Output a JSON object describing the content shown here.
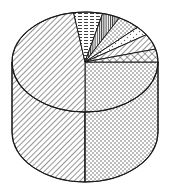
{
  "figure": {
    "title": "",
    "background": "#ffffff",
    "stroke_color": "#1a1a1a",
    "fill_color": "#ffffff"
  },
  "geometry": {
    "center_x": 85,
    "center_y": 62,
    "radius_x": 73,
    "radius_y": 50,
    "depth": 70,
    "start_angle_deg": 0,
    "direction": "clockwise"
  },
  "chart_data": {
    "type": "pie",
    "title": "",
    "subtitle": "",
    "xlabel": "",
    "ylabel": "",
    "legend_position": "none",
    "grid": false,
    "three_d": true,
    "three_d_style": "cylinder",
    "total": 100,
    "categories": [
      "Slice 1",
      "Slice 2",
      "Slice 3",
      "Slice 4",
      "Slice 5",
      "Slice 6",
      "Slice 7",
      "Slice 8"
    ],
    "values": [
      25.0,
      47.5,
      6.5,
      4.0,
      5.0,
      3.0,
      5.0,
      4.0
    ],
    "labels": [],
    "slices": [
      {
        "name": "Slice 1",
        "value": 25.0,
        "start_deg": 0,
        "end_deg": 90,
        "pattern": "dots",
        "pattern_label": "fine-dot-stipple",
        "fill": "#ffffff",
        "stroke": "#1a1a1a"
      },
      {
        "name": "Slice 2",
        "value": 47.5,
        "start_deg": 90,
        "end_deg": 261,
        "pattern": "diagonal-hatch",
        "pattern_label": "diagonal-hatch-45",
        "fill": "#ffffff",
        "stroke": "#1a1a1a"
      },
      {
        "name": "Slice 3",
        "value": 6.5,
        "start_deg": 261,
        "end_deg": 284,
        "pattern": "horizontal-dash",
        "pattern_label": "horizontal-dashed-lines",
        "fill": "#ffffff",
        "stroke": "#1a1a1a"
      },
      {
        "name": "Slice 4",
        "value": 4.0,
        "start_deg": 284,
        "end_deg": 298,
        "pattern": "vertical-lines",
        "pattern_label": "dense-vertical-lines",
        "fill": "#ffffff",
        "stroke": "#1a1a1a"
      },
      {
        "name": "Slice 5",
        "value": 5.0,
        "start_deg": 298,
        "end_deg": 316,
        "pattern": "dots",
        "pattern_label": "fine-dot-stipple",
        "fill": "#ffffff",
        "stroke": "#1a1a1a"
      },
      {
        "name": "Slice 6",
        "value": 3.0,
        "start_deg": 316,
        "end_deg": 327,
        "pattern": "sparse-dots",
        "pattern_label": "sparse-dot-stipple",
        "fill": "#ffffff",
        "stroke": "#1a1a1a"
      },
      {
        "name": "Slice 7",
        "value": 5.0,
        "start_deg": 327,
        "end_deg": 345,
        "pattern": "diagonal-hatch",
        "pattern_label": "diagonal-hatch-45",
        "fill": "#ffffff",
        "stroke": "#1a1a1a"
      },
      {
        "name": "Slice 8",
        "value": 4.0,
        "start_deg": 345,
        "end_deg": 360,
        "pattern": "cross-hatch",
        "pattern_label": "diagonal-cross-hatch",
        "fill": "#ffffff",
        "stroke": "#1a1a1a"
      }
    ],
    "side_walls": [
      {
        "name": "Slice 2 wall",
        "pattern": "diagonal-hatch",
        "from_deg": 90,
        "to_deg": 180
      },
      {
        "name": "Slice 1 wall",
        "pattern": "dots",
        "from_deg": 0,
        "to_deg": 90
      }
    ]
  }
}
